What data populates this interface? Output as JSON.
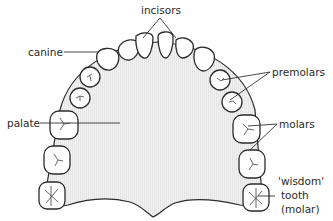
{
  "diagram": {
    "type": "anatomical diagram",
    "labels": {
      "incisors": "incisors",
      "canine": "canine",
      "premolars": "premolars",
      "palate": "palate",
      "molars": "molars",
      "wisdom_line1": "'wisdom'",
      "wisdom_line2": "tooth",
      "wisdom_line3": "(molar)"
    },
    "colors": {
      "palate_fill": "#efefef",
      "outline": "#2b2b2b",
      "tooth_fill": "#ffffff",
      "text": "#2a2a2a"
    }
  }
}
